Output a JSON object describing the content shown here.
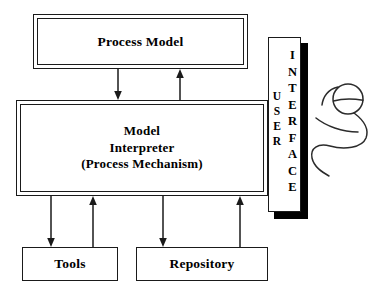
{
  "diagram": {
    "background_color": "#ffffff",
    "line_color": "#1a1a1a",
    "shadow_color": "#000000"
  },
  "nodes": {
    "process_model": {
      "label": "Process Model",
      "style": "double-border"
    },
    "model_interpreter": {
      "label": "Model\nInterpreter\n(Process Mechanism)",
      "line1": "Model",
      "line2": "Interpreter",
      "line3": "(Process Mechanism)",
      "style": "double-border"
    },
    "tools": {
      "label": "Tools",
      "style": "single-border"
    },
    "repository": {
      "label": "Repository",
      "style": "single-border"
    },
    "user_interface": {
      "word_user": "USER",
      "word_interface": "INTERFACE",
      "user_letters": [
        "U",
        "S",
        "E",
        "R"
      ],
      "interface_letters": [
        "I",
        "N",
        "T",
        "E",
        "R",
        "F",
        "A",
        "C",
        "E"
      ],
      "style": "vertical-bar-with-shadow"
    }
  },
  "connections": [
    {
      "name": "process-model-to-interpreter",
      "direction": "down",
      "from": "process_model",
      "to": "model_interpreter"
    },
    {
      "name": "interpreter-to-process-model",
      "direction": "up",
      "from": "model_interpreter",
      "to": "process_model"
    },
    {
      "name": "interpreter-to-tools",
      "direction": "down",
      "from": "model_interpreter",
      "to": "tools"
    },
    {
      "name": "tools-to-interpreter",
      "direction": "up",
      "from": "tools",
      "to": "model_interpreter"
    },
    {
      "name": "interpreter-to-repository",
      "direction": "down",
      "from": "model_interpreter",
      "to": "repository"
    },
    {
      "name": "repository-to-interpreter",
      "direction": "up",
      "from": "repository",
      "to": "model_interpreter"
    }
  ],
  "decorations": {
    "stick_figure": "hand-drawn-user-figure"
  }
}
